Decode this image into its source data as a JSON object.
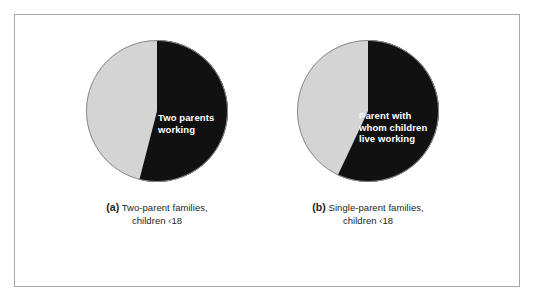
{
  "figure": {
    "border_color": "#a6a6a6",
    "background": "#ffffff"
  },
  "colors": {
    "working_slice": "#111111",
    "other_slice": "#d4d4d4",
    "label_text": "#ffffff",
    "caption_text": "#231f20"
  },
  "panels": [
    {
      "id": "a",
      "tag": "(a)",
      "caption_line1": "Two-parent families,",
      "caption_line2": "children ‹18",
      "slice_label_line1": "Two parents",
      "slice_label_line2": "working"
    },
    {
      "id": "b",
      "tag": "(b)",
      "caption_line1": "Single-parent families,",
      "caption_line2": "children ‹18",
      "slice_label_line1": "Parent with",
      "slice_label_line2": "whom children",
      "slice_label_line3": "live working"
    }
  ],
  "chart_data": [
    {
      "type": "pie",
      "title": "(a) Two-parent families, children <18",
      "categories": [
        "Two parents working",
        "Other"
      ],
      "values": [
        54,
        46
      ],
      "value_unit": "percent",
      "labels_shown": [
        "Two parents working"
      ],
      "colors": [
        "#111111",
        "#d4d4d4"
      ],
      "start_angle_deg": 0,
      "direction": "clockwise",
      "legend": "none",
      "grid": false
    },
    {
      "type": "pie",
      "title": "(b) Single-parent families, children <18",
      "categories": [
        "Parent with whom children live working",
        "Other"
      ],
      "values": [
        57,
        43
      ],
      "value_unit": "percent",
      "labels_shown": [
        "Parent with whom children live working"
      ],
      "colors": [
        "#111111",
        "#d4d4d4"
      ],
      "start_angle_deg": 0,
      "direction": "clockwise",
      "legend": "none",
      "grid": false
    }
  ]
}
